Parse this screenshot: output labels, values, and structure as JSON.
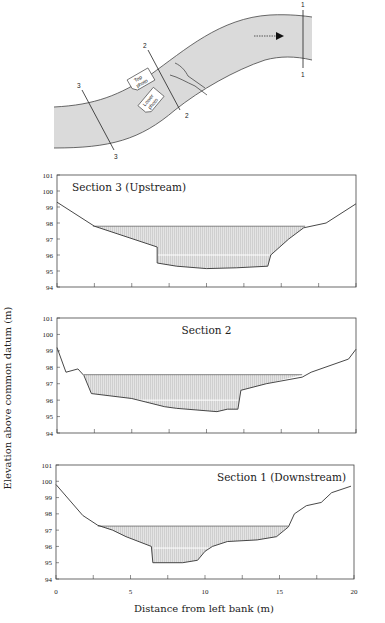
{
  "figure": {
    "ylabel": "Elevation above common datum (m)",
    "xlabel": "Distance from left bank (m)"
  },
  "map": {
    "section_labels": {
      "s1_top": "1",
      "s1_bottom": "1",
      "s2_top": "2",
      "s2_bottom": "2",
      "s3_top": "3",
      "s3_bottom": "3"
    },
    "photo_top": [
      "Top",
      "photo"
    ],
    "photo_lower": [
      "Lower",
      "photo"
    ],
    "flow_direction": "arrow-right-icon"
  },
  "colors": {
    "channel_fill": "#d9d9d9",
    "line": "#333333",
    "water_fill": "#dcdcdc",
    "water_line": "#ffffff"
  },
  "chart_data": [
    {
      "type": "area",
      "title": "Section 3 (Upstream)",
      "xlabel": "Distance from left bank (m)",
      "ylabel": "Elevation above common datum (m)",
      "xlim": [
        0,
        20
      ],
      "ylim": [
        94,
        101
      ],
      "yticks": [
        "94",
        "95",
        "96",
        "97",
        "98",
        "99",
        "100",
        "101"
      ],
      "xticks": [
        0,
        2.5,
        5,
        7.5,
        10,
        12.5,
        15,
        17.5,
        20
      ],
      "profile": [
        [
          0,
          99.3
        ],
        [
          2.5,
          97.8
        ],
        [
          6.7,
          96.5
        ],
        [
          6.7,
          95.5
        ],
        [
          8,
          95.3
        ],
        [
          10,
          95.15
        ],
        [
          12,
          95.2
        ],
        [
          14.1,
          95.3
        ],
        [
          14.3,
          96.0
        ],
        [
          15.5,
          97.0
        ],
        [
          16.5,
          97.7
        ],
        [
          18,
          98.0
        ],
        [
          20,
          99.2
        ]
      ],
      "water_surface": {
        "elevation": 97.8,
        "x_start": 2.4,
        "x_end": 16.6
      },
      "inner_line": {
        "elevation": 96.0,
        "x_start": 6.7,
        "x_end": 14.3
      },
      "title_pos": "left"
    },
    {
      "type": "area",
      "title": "Section 2",
      "xlabel": "Distance from left bank (m)",
      "ylabel": "Elevation above common datum (m)",
      "xlim": [
        0,
        20
      ],
      "ylim": [
        94,
        101
      ],
      "yticks": [
        "94",
        "95",
        "96",
        "97",
        "98",
        "99",
        "100",
        "101"
      ],
      "xticks": [
        0,
        2.5,
        5,
        7.5,
        10,
        12.5,
        15,
        17.5,
        20
      ],
      "profile": [
        [
          0,
          99.2
        ],
        [
          0.6,
          97.7
        ],
        [
          1.4,
          97.9
        ],
        [
          1.8,
          97.5
        ],
        [
          2.3,
          96.4
        ],
        [
          5,
          96.1
        ],
        [
          7.2,
          95.6
        ],
        [
          8,
          95.5
        ],
        [
          10.7,
          95.3
        ],
        [
          11.4,
          95.45
        ],
        [
          12.1,
          95.45
        ],
        [
          12.3,
          96.6
        ],
        [
          14,
          97.0
        ],
        [
          16.4,
          97.4
        ],
        [
          17,
          97.7
        ],
        [
          19.5,
          98.5
        ],
        [
          20,
          99.1
        ]
      ],
      "water_surface": {
        "elevation": 97.55,
        "x_start": 1.8,
        "x_end": 16.4
      },
      "inner_line": {
        "elevation": 96.0,
        "x_start": 5.0,
        "x_end": 12.2
      },
      "title_pos": "center"
    },
    {
      "type": "area",
      "title": "Section 1 (Downstream)",
      "xlabel": "Distance from left bank (m)",
      "ylabel": "Elevation above common datum (m)",
      "xlim": [
        0,
        20
      ],
      "ylim": [
        94,
        101
      ],
      "yticks": [
        "94",
        "95",
        "96",
        "97",
        "98",
        "99",
        "100",
        "101"
      ],
      "xticks": [
        0,
        2.5,
        5,
        7.5,
        10,
        12.5,
        15,
        17.5,
        20
      ],
      "xticklabels": [
        "0",
        "5",
        "10",
        "15",
        "20"
      ],
      "profile": [
        [
          0,
          99.8
        ],
        [
          1.8,
          97.9
        ],
        [
          2.8,
          97.3
        ],
        [
          3.8,
          97.0
        ],
        [
          4.7,
          96.6
        ],
        [
          6.4,
          96.0
        ],
        [
          6.5,
          95.0
        ],
        [
          8.5,
          95.0
        ],
        [
          9.5,
          95.15
        ],
        [
          10,
          95.7
        ],
        [
          10.5,
          96.0
        ],
        [
          11.5,
          96.3
        ],
        [
          13.5,
          96.4
        ],
        [
          14.8,
          96.6
        ],
        [
          15.6,
          97.2
        ],
        [
          16,
          98.0
        ],
        [
          16.8,
          98.5
        ],
        [
          17.8,
          98.7
        ],
        [
          18.5,
          99.3
        ],
        [
          19.8,
          99.7
        ]
      ],
      "water_surface": {
        "elevation": 97.25,
        "x_start": 2.8,
        "x_end": 15.6
      },
      "inner_line": {
        "elevation": 95.9,
        "x_start": 6.5,
        "x_end": 10.5
      },
      "title_pos": "right"
    }
  ]
}
